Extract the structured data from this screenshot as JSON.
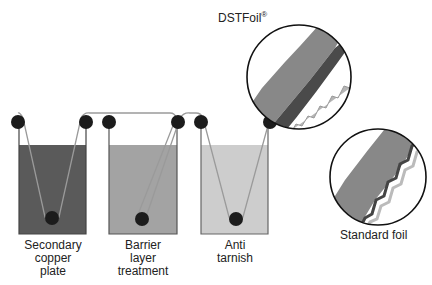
{
  "tanks": [
    {
      "label_lines": [
        "Secondary",
        "copper",
        "plate"
      ],
      "fill": "#5a5a5a"
    },
    {
      "label_lines": [
        "Barrier",
        "layer",
        "treatment"
      ],
      "fill": "#a3a3a3"
    },
    {
      "label_lines": [
        "Anti",
        "tarnish"
      ],
      "fill": "#cdcdcd"
    }
  ],
  "callouts": {
    "dstfoil": {
      "label": "DSTFoil",
      "mark": "®"
    },
    "standard": {
      "label": "Standard foil"
    }
  },
  "colors": {
    "roller": "#1c1c1c",
    "foil_path": "#9a9a9a",
    "tank_outline": "#444444",
    "foil_body": "#8a8a8a"
  }
}
